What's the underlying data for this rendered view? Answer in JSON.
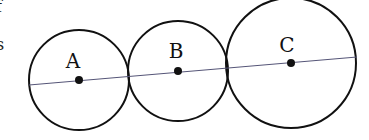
{
  "diagram": {
    "type": "tangent-circles",
    "line_color": "#555577",
    "stroke_color": "#111111",
    "line": {
      "x1": 29,
      "y1": 85,
      "x2": 357,
      "y2": 57
    },
    "circles": [
      {
        "id": "A",
        "label": "A",
        "cx": 79,
        "cy": 80,
        "r": 50,
        "label_x": 73,
        "label_y": 68
      },
      {
        "id": "B",
        "label": "B",
        "cx": 178,
        "cy": 71,
        "r": 50,
        "label_x": 176,
        "label_y": 58
      },
      {
        "id": "C",
        "label": "C",
        "cx": 291,
        "cy": 63,
        "r": 65,
        "label_x": 287,
        "label_y": 52
      }
    ],
    "edge_fragments": [
      "f",
      "s"
    ]
  }
}
